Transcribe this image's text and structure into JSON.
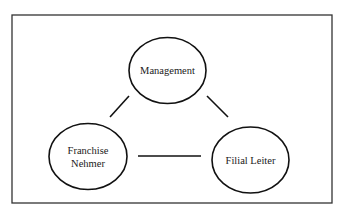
{
  "diagram": {
    "frame": {
      "x": 12,
      "y": 15,
      "width": 320,
      "height": 188,
      "stroke": "#333333"
    },
    "nodes": [
      {
        "id": "management",
        "label": "Management",
        "lines": [
          "Management"
        ],
        "cx": 167.5,
        "cy": 70.5,
        "rx": 38.5,
        "ry": 33
      },
      {
        "id": "franchise-nehmer",
        "label": "Franchise Nehmer",
        "lines": [
          "Franchise",
          "Nehmer"
        ],
        "cx": 88,
        "cy": 156.5,
        "rx": 39,
        "ry": 33
      },
      {
        "id": "filial-leiter",
        "label": "Filial Leiter",
        "lines": [
          "Filial Leiter"
        ],
        "cx": 250.5,
        "cy": 160,
        "rx": 38.5,
        "ry": 33
      }
    ],
    "edges": [
      {
        "from": "management",
        "to": "franchise-nehmer",
        "x1": 129,
        "y1": 96,
        "x2": 110,
        "y2": 117
      },
      {
        "from": "management",
        "to": "filial-leiter",
        "x1": 207,
        "y1": 96,
        "x2": 228,
        "y2": 117
      },
      {
        "from": "franchise-nehmer",
        "to": "filial-leiter",
        "x1": 138,
        "y1": 156,
        "x2": 201,
        "y2": 156
      }
    ],
    "stroke_color": "#111111"
  }
}
